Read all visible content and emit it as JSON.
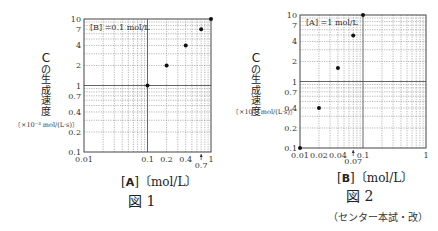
{
  "chart_data": [
    {
      "type": "scatter",
      "title": "図 1",
      "xscale": "log",
      "yscale": "log",
      "xlim": [
        0.01,
        1
      ],
      "ylim": [
        0.1,
        10
      ],
      "xlabel": "[A]〔mol/L〕",
      "ylabel": "Cの生成速度〔×10⁻³ mol/(L·s)〕",
      "annotation": "[B] =0.1 mol/L",
      "xticks": [
        "0.01",
        "0.1",
        "0.2",
        "0.4",
        "0.7",
        "1"
      ],
      "yticks": [
        "0.1",
        "0.2",
        "0.4",
        "0.7",
        "1",
        "2",
        "4",
        "7",
        "10"
      ],
      "x": [
        0.1,
        0.2,
        0.4,
        0.7,
        1
      ],
      "y": [
        1,
        2,
        4,
        7,
        10
      ],
      "grid": true
    },
    {
      "type": "scatter",
      "title": "図 2",
      "xscale": "log",
      "yscale": "log",
      "xlim": [
        0.01,
        1
      ],
      "ylim": [
        0.1,
        10
      ],
      "xlabel": "[B]〔mol/L〕",
      "ylabel": "Cの生成速度〔×10⁻³ mol/(L·s)〕",
      "annotation": "[A] =1 mol/L",
      "xticks": [
        "0.01",
        "0.02",
        "0.04",
        "0.07",
        "0.1",
        "1"
      ],
      "yticks": [
        "0.1",
        "0.2",
        "0.4",
        "0.7",
        "1",
        "2",
        "4",
        "7",
        "10"
      ],
      "x": [
        0.01,
        0.02,
        0.04,
        0.07,
        0.1
      ],
      "y": [
        0.1,
        0.4,
        1.6,
        4.9,
        10
      ],
      "grid": true
    }
  ],
  "fig1": {
    "ylabel_c": "C",
    "ylabel_chars": [
      "の",
      "生",
      "成",
      "速",
      "度"
    ],
    "unit": "〔×10⁻³ mol/(L·s)〕",
    "xlabel_sym": "A",
    "xlabel_unit": "〔mol/L〕",
    "caption": "図 1",
    "annotation": "[B] =0.1 mol/L"
  },
  "fig2": {
    "ylabel_c": "C",
    "ylabel_chars": [
      "の",
      "生",
      "成",
      "速",
      "度"
    ],
    "unit": "〔×10⁻³ mol/(L·s)〕",
    "xlabel_sym": "B",
    "xlabel_unit": "〔mol/L〕",
    "caption": "図 2",
    "annotation": "[A] =1 mol/L"
  },
  "source": "（センター本試・改）"
}
